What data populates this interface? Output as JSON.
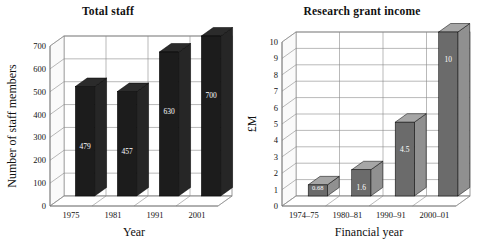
{
  "figure": {
    "width": 492,
    "height": 244,
    "background": "#ffffff"
  },
  "charts": [
    {
      "id": "total-staff",
      "title": "Total staff",
      "xlabel": "Year",
      "ylabel": "Number of staff members",
      "bar_color": "#1c1c1c",
      "bar_side_color": "#3a3a3a",
      "bar_top_color": "#2a2a2a"
    },
    {
      "id": "research-grant-income",
      "title": "Research grant income",
      "xlabel": "Financial year",
      "ylabel": "£M",
      "bar_color": "#6b6b6b",
      "bar_side_color": "#4f4f4f",
      "bar_top_color": "#5a5a5a"
    }
  ],
  "chart_data": [
    {
      "type": "bar",
      "title": "Total staff",
      "xlabel": "Year",
      "ylabel": "Number of staff members",
      "categories": [
        "1975",
        "1981",
        "1991",
        "2001"
      ],
      "values": [
        479,
        457,
        630,
        700
      ],
      "value_labels": [
        "479",
        "457",
        "630",
        "700"
      ],
      "ylim": [
        0,
        700
      ],
      "yticks": [
        0,
        100,
        200,
        300,
        400,
        500,
        600,
        700
      ],
      "ytick_labels": [
        "0",
        "100",
        "200",
        "300",
        "400",
        "500",
        "600",
        "700"
      ],
      "grid": true,
      "legend": false,
      "style": "3d-column",
      "bar_color": "#1c1c1c"
    },
    {
      "type": "bar",
      "title": "Research grant income",
      "xlabel": "Financial year",
      "ylabel": "£M",
      "categories": [
        "1974–75",
        "1980–81",
        "1990–91",
        "2000–01"
      ],
      "values": [
        0.68,
        1.6,
        4.5,
        10
      ],
      "value_labels": [
        "0.68",
        "1.6",
        "4.5",
        "10"
      ],
      "ylim": [
        0,
        10
      ],
      "yticks": [
        0,
        1,
        2,
        3,
        4,
        5,
        6,
        7,
        8,
        9,
        10
      ],
      "ytick_labels": [
        "0",
        "1",
        "2",
        "3",
        "4",
        "5",
        "6",
        "7",
        "8",
        "9",
        "10"
      ],
      "grid": true,
      "legend": false,
      "style": "3d-column",
      "bar_color": "#6b6b6b"
    }
  ]
}
